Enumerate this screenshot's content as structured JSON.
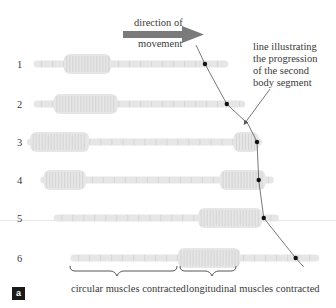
{
  "figure": {
    "direction_label_line1": "direction of",
    "direction_label_line2": "movement",
    "annotation": [
      "line illustrating",
      "the progression",
      "of the second",
      "body segment"
    ],
    "brace_labels": {
      "circular": "circular muscles contracted",
      "longitudinal": "longitudinal muscles contracted"
    },
    "panel_label": "a",
    "colors": {
      "arrow": "#7a7a7a",
      "worm_body": "#e6e6e6",
      "worm_ring": "#cfcfcf",
      "line": "#555555",
      "marker": "#111111"
    }
  },
  "stages": [
    {
      "label": "1",
      "start": 0.1,
      "end": 0.68,
      "bulge_start": 0.19,
      "bulge_end": 0.33,
      "marker": 0.61
    },
    {
      "label": "2",
      "start": 0.1,
      "end": 0.73,
      "bulge_start": 0.16,
      "bulge_end": 0.35,
      "marker": 0.675
    },
    {
      "label": "3",
      "start": 0.08,
      "end": 0.78,
      "bulge_start": 0.09,
      "bulge_end": 0.265,
      "bulge2_start": 0.695,
      "bulge2_end": 0.77,
      "marker": 0.765
    },
    {
      "label": "4",
      "start": 0.12,
      "end": 0.815,
      "bulge_start": 0.13,
      "bulge_end": 0.255,
      "bulge2_start": 0.655,
      "bulge2_end": 0.79,
      "marker": 0.77
    },
    {
      "label": "5",
      "start": 0.16,
      "end": 0.83,
      "bulge_start": 0.59,
      "bulge_end": 0.78,
      "marker": 0.785
    },
    {
      "label": "6",
      "start": 0.21,
      "end": 0.95,
      "bulge_start": 0.53,
      "bulge_end": 0.715,
      "marker": 0.88
    }
  ]
}
